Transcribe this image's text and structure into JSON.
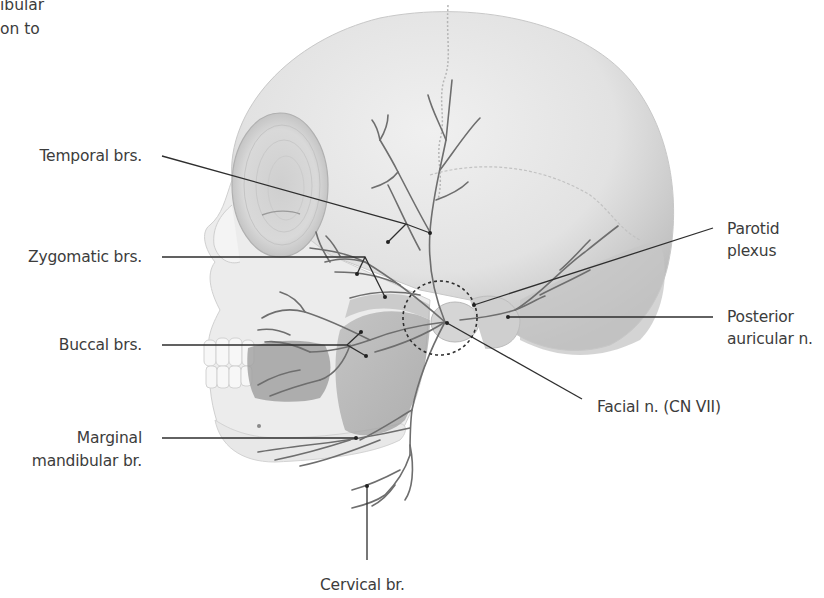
{
  "figure": {
    "cutoff_text_top_left": [
      "ibular",
      "on to"
    ],
    "labels": {
      "temporal": "Temporal brs.",
      "zygomatic": "Zygomatic brs.",
      "buccal": "Buccal brs.",
      "marginal_line1": "Marginal",
      "marginal_line2": "mandibular br.",
      "parotid_line1": "Parotid",
      "parotid_line2": "plexus",
      "posterior_line1": "Posterior",
      "posterior_line2": "auricular n.",
      "facial": "Facial n. (CN VII)",
      "cervical": "Cervical br."
    },
    "colors": {
      "background": "#ffffff",
      "bone": "#e6e6e6",
      "bone_shadow": "#bdbdbd",
      "muscle": "#a9a9a9",
      "nerve": "#6e6e6e",
      "leader_line": "#2e2e2e",
      "text": "#3c3c3c"
    }
  }
}
